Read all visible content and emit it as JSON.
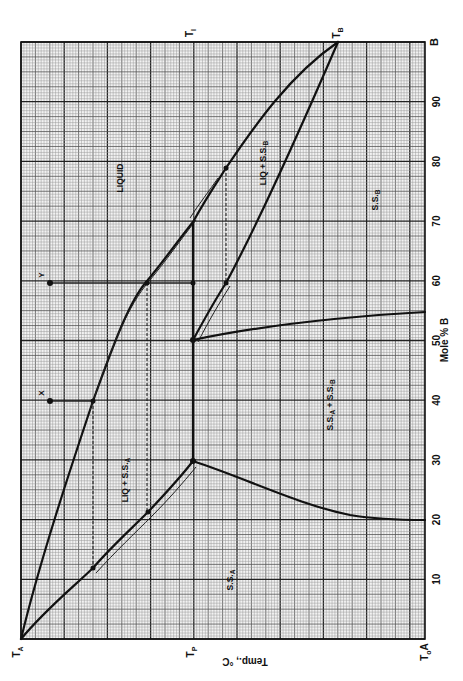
{
  "chart_data": {
    "type": "line",
    "title": "",
    "subtitle": "Binary phase diagram (rotated 90°): peritectic system A–B",
    "orientation": "rotated: composition axis vertical on right (0 at bottom, 100 at top), temperature axis horizontal at bottom (high T at left)",
    "xlabel": "Mole % B",
    "ylabel": "Temp., °C",
    "x_ticks": [
      "A",
      "10",
      "20",
      "30",
      "40",
      "50",
      "60",
      "70",
      "80",
      "90",
      "B"
    ],
    "x_tick_values": [
      0,
      10,
      20,
      30,
      40,
      50,
      60,
      70,
      80,
      90,
      100
    ],
    "x_range": [
      0,
      100
    ],
    "temperature_markers": [
      "T_A",
      "T_P",
      "T_0"
    ],
    "top_markers": [
      "T_I",
      "T_B"
    ],
    "grid": true,
    "legend": null,
    "regions": [
      "LIQUID",
      "LIQ + S.S.A",
      "LIQ + S.S.B",
      "S.S.A",
      "S.S.B",
      "S.S.A + S.S.B"
    ],
    "points": [
      {
        "label": "X",
        "mole_pct_B": 40
      },
      {
        "label": "Y",
        "mole_pct_B": 60
      }
    ],
    "series": [
      {
        "name": "Liquidus (A side)",
        "mole_pct_B": [
          0,
          12,
          40,
          60,
          70
        ],
        "temp_rel": [
          1.0,
          0.86,
          0.82,
          0.68,
          0.57
        ]
      },
      {
        "name": "Liquidus (B side)",
        "mole_pct_B": [
          70,
          79,
          90,
          100
        ],
        "temp_rel": [
          0.57,
          0.49,
          0.36,
          0.21
        ]
      },
      {
        "name": "Solidus S.S.A",
        "mole_pct_B": [
          0,
          12,
          21,
          30
        ],
        "temp_rel": [
          1.0,
          0.81,
          0.68,
          0.57
        ]
      },
      {
        "name": "Solidus S.S.B",
        "mole_pct_B": [
          50,
          60,
          100
        ],
        "temp_rel": [
          0.57,
          0.49,
          0.21
        ]
      },
      {
        "name": "Peritectic isotherm T_P",
        "mole_pct_B": [
          30,
          50,
          70
        ],
        "temp_rel": [
          0.57,
          0.57,
          0.57
        ]
      },
      {
        "name": "Solvus S.S.A",
        "mole_pct_B": [
          30,
          24,
          20
        ],
        "temp_rel": [
          0.57,
          0.3,
          0.0
        ]
      },
      {
        "name": "Solvus S.S.B",
        "mole_pct_B": [
          50,
          53,
          55
        ],
        "temp_rel": [
          0.57,
          0.3,
          0.0
        ]
      }
    ]
  },
  "labels": {
    "t_a": "T",
    "t_a_sub": "A",
    "t_p": "T",
    "t_p_sub": "P",
    "t_0": "T",
    "t_0_sub": "o",
    "t_0_after": "A",
    "t_i": "T",
    "t_i_sub": "I",
    "t_b": "T",
    "t_b_sub": "B",
    "temp_axis": "Temp., °C",
    "mole_axis": "Mole % B",
    "liquid": "LIQUID",
    "liq_ssa": "LIQ + S.S.",
    "liq_ssa_sub": "A",
    "liq_ssb": "LIQ + S.S.",
    "liq_ssb_sub": "B",
    "ssa": "S.S.",
    "ssa_sub": "A",
    "ssb": "S.S.",
    "ssb_sub": "B",
    "ssab": "S.S.",
    "ssab_sub1": "A",
    "ssab_mid": " + S.S.",
    "ssab_sub2": "B",
    "point_x": "X",
    "point_y": "Y",
    "tick_b": "B",
    "ticks": [
      "10",
      "20",
      "30",
      "40",
      "50",
      "60",
      "70",
      "80",
      "90"
    ]
  }
}
